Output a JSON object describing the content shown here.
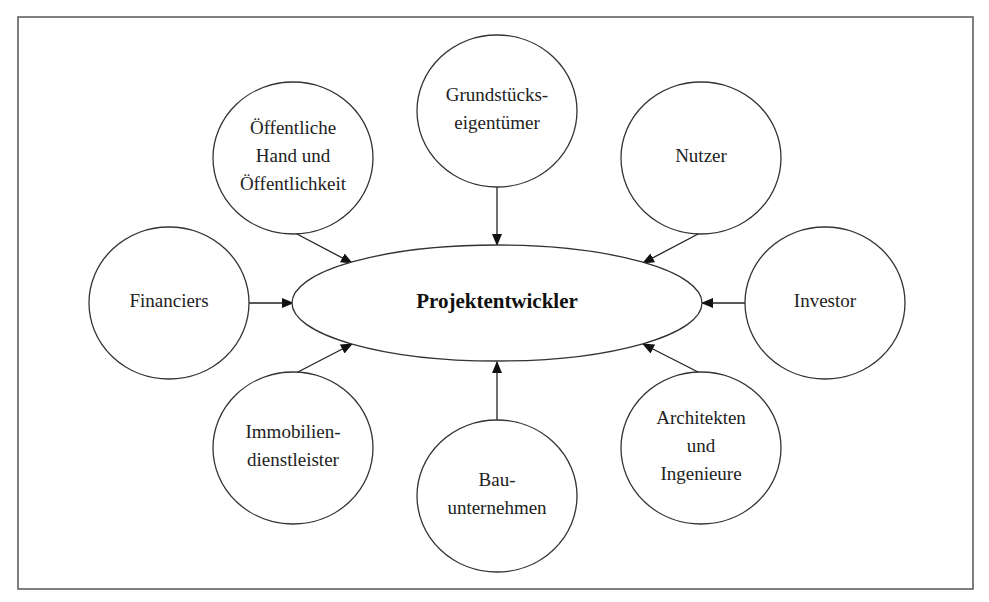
{
  "diagram": {
    "type": "stakeholder-hub",
    "center": {
      "id": "projektentwickler",
      "label": "Projektentwickler",
      "cx": 497,
      "cy": 303,
      "rx": 205,
      "ry": 58
    },
    "nodes": [
      {
        "id": "grundstueckseigentuemer",
        "lines": [
          "Grundstücks-",
          "eigentümer"
        ],
        "cx": 497,
        "cy": 111,
        "r": 78
      },
      {
        "id": "oeffentliche-hand",
        "lines": [
          "Öffentliche",
          "Hand und",
          "Öffentlichkeit"
        ],
        "cx": 293,
        "cy": 158,
        "r": 78
      },
      {
        "id": "nutzer",
        "lines": [
          "Nutzer"
        ],
        "cx": 701,
        "cy": 158,
        "r": 78
      },
      {
        "id": "financiers",
        "lines": [
          "Financiers"
        ],
        "cx": 169,
        "cy": 303,
        "r": 78
      },
      {
        "id": "investor",
        "lines": [
          "Investor"
        ],
        "cx": 825,
        "cy": 303,
        "r": 78
      },
      {
        "id": "immobiliendienstleister",
        "lines": [
          "Immobilien-",
          "dienstleister"
        ],
        "cx": 293,
        "cy": 448,
        "r": 78
      },
      {
        "id": "architekten-ingenieure",
        "lines": [
          "Architekten",
          "und",
          "Ingenieure"
        ],
        "cx": 701,
        "cy": 448,
        "r": 78
      },
      {
        "id": "bauunternehmen",
        "lines": [
          "Bau-",
          "unternehmen"
        ],
        "cx": 497,
        "cy": 496,
        "r": 78
      }
    ],
    "edges": [
      {
        "from": "grundstueckseigentuemer",
        "to": "projektentwickler",
        "x1": 497,
        "y1": 187,
        "x2": 497,
        "y2": 245
      },
      {
        "from": "oeffentliche-hand",
        "to": "projektentwickler",
        "x1": 295,
        "y1": 233,
        "x2": 352,
        "y2": 263
      },
      {
        "from": "nutzer",
        "to": "projektentwickler",
        "x1": 700,
        "y1": 233,
        "x2": 643,
        "y2": 263
      },
      {
        "from": "financiers",
        "to": "projektentwickler",
        "x1": 248,
        "y1": 303,
        "x2": 293,
        "y2": 303
      },
      {
        "from": "investor",
        "to": "projektentwickler",
        "x1": 746,
        "y1": 303,
        "x2": 702,
        "y2": 303
      },
      {
        "from": "immobiliendienstleister",
        "to": "projektentwickler",
        "x1": 296,
        "y1": 373,
        "x2": 352,
        "y2": 344
      },
      {
        "from": "architekten-ingenieure",
        "to": "projektentwickler",
        "x1": 700,
        "y1": 373,
        "x2": 643,
        "y2": 344
      },
      {
        "from": "bauunternehmen",
        "to": "projektentwickler",
        "x1": 497,
        "y1": 420,
        "x2": 497,
        "y2": 362
      }
    ],
    "frame": {
      "x": 18,
      "y": 17,
      "width": 955,
      "height": 572
    },
    "colors": {
      "stroke": "#333333",
      "text": "#222222",
      "background": "#ffffff"
    }
  }
}
